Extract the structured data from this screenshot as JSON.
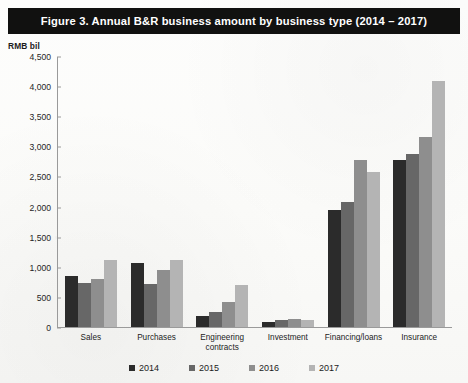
{
  "figure": {
    "title": "Figure 3.  Annual B&R business amount by business type (2014 – 2017)",
    "unit_label": "RMB bil"
  },
  "colors": {
    "title_bar_bg": "#111110",
    "title_bar_text": "#ffffff",
    "axis": "#9a9a9a",
    "series_2014": "#2b2b2b",
    "series_2015": "#676767",
    "series_2016": "#8e8e8e",
    "series_2017": "#b4b4b4"
  },
  "chart_data": {
    "type": "bar",
    "title": "Figure 3.  Annual B&R business amount by business type (2014 – 2017)",
    "xlabel": "",
    "ylabel": "RMB bil",
    "ylim": [
      0,
      4500
    ],
    "ytick_labels": [
      "4,500",
      "4,000",
      "3,500",
      "3,000",
      "2,500",
      "2,000",
      "1,500",
      "1,000",
      "500",
      "0"
    ],
    "ytick_values": [
      4500,
      4000,
      3500,
      3000,
      2500,
      2000,
      1500,
      1000,
      500,
      0
    ],
    "grid": false,
    "legend_position": "bottom",
    "categories": [
      "Sales",
      "Purchases",
      "Engineering contracts",
      "Investment",
      "Financing/loans",
      "Insurance"
    ],
    "category_lines": [
      [
        "Sales"
      ],
      [
        "Purchases"
      ],
      [
        "Engineering",
        "contracts"
      ],
      [
        "Investment"
      ],
      [
        "Financing/loans"
      ],
      [
        "Insurance"
      ]
    ],
    "series": [
      {
        "name": "2014",
        "color": "#2b2b2b",
        "values": [
          850,
          1070,
          180,
          80,
          1950,
          2770
        ]
      },
      {
        "name": "2015",
        "color": "#676767",
        "values": [
          730,
          720,
          250,
          110,
          2070,
          2870
        ]
      },
      {
        "name": "2016",
        "color": "#8e8e8e",
        "values": [
          790,
          950,
          420,
          130,
          2780,
          3150
        ]
      },
      {
        "name": "2017",
        "color": "#b4b4b4",
        "values": [
          1120,
          1120,
          700,
          110,
          2570,
          4080
        ]
      }
    ]
  }
}
